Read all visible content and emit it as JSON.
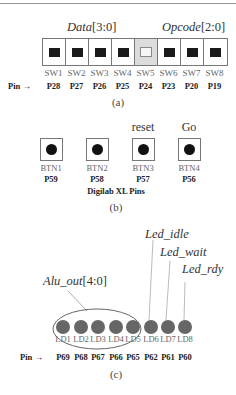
{
  "panel_a": {
    "group_labels": {
      "data": {
        "name": "Data",
        "bits": "[3:0]"
      },
      "opcode": {
        "name": "Opcode",
        "bits": "[2:0]"
      }
    },
    "switches": [
      {
        "label": "SW1",
        "pin": "P28",
        "state": "on"
      },
      {
        "label": "SW2",
        "pin": "P27",
        "state": "on"
      },
      {
        "label": "SW3",
        "pin": "P26",
        "state": "on"
      },
      {
        "label": "SW4",
        "pin": "P25",
        "state": "on"
      },
      {
        "label": "SW5",
        "pin": "P24",
        "state": "off"
      },
      {
        "label": "SW6",
        "pin": "P23",
        "state": "on"
      },
      {
        "label": "SW7",
        "pin": "P20",
        "state": "on"
      },
      {
        "label": "SW8",
        "pin": "P19",
        "state": "on"
      }
    ],
    "pin_label": "Pin",
    "arrow": "→",
    "caption": "(a)"
  },
  "panel_b": {
    "buttons": [
      {
        "label": "BTN1",
        "pin": "P59",
        "function": ""
      },
      {
        "label": "BTN2",
        "pin": "P58",
        "function": ""
      },
      {
        "label": "BTN3",
        "pin": "P57",
        "function": "reset"
      },
      {
        "label": "BTN4",
        "pin": "P56",
        "function": "Go"
      }
    ],
    "board_label": "Digilab XL Pins",
    "caption": "(b)"
  },
  "panel_c": {
    "group_label": {
      "name": "Alu_out",
      "bits": "[4:0]"
    },
    "signal_labels": {
      "idle": "Led_idle",
      "wait": "Led_wait",
      "rdy": "Led_rdy"
    },
    "leds": [
      {
        "label": "LD1",
        "pin": "P69"
      },
      {
        "label": "LD2",
        "pin": "P68"
      },
      {
        "label": "LD3",
        "pin": "P67"
      },
      {
        "label": "LD4",
        "pin": "P66"
      },
      {
        "label": "LD5",
        "pin": "P65"
      },
      {
        "label": "LD6",
        "pin": "P62"
      },
      {
        "label": "LD7",
        "pin": "P61"
      },
      {
        "label": "LD8",
        "pin": "P60"
      }
    ],
    "pin_label": "Pin",
    "arrow": "→",
    "caption": "(c)"
  }
}
